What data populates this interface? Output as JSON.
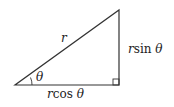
{
  "diagram": {
    "type": "right-triangle",
    "labels": {
      "hypotenuse": "r",
      "angle": "θ",
      "opposite_var": "r",
      "opposite_fn": "sin",
      "opposite_angle": "θ",
      "adjacent_var": "r",
      "adjacent_fn": "cos",
      "adjacent_angle": "θ"
    },
    "stroke_color": "#333333"
  }
}
